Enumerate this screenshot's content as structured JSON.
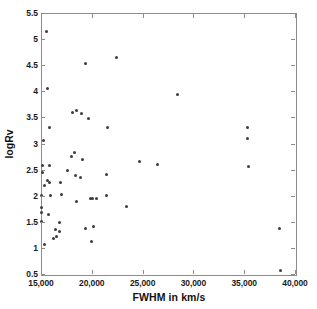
{
  "figure": {
    "top_clip_text": "· · · · · · · · · · · · · · · ·",
    "background_color": "#ffffff",
    "frame_color": "#8c8c8c",
    "marker_color": "#3b3b3b"
  },
  "chart_data": {
    "type": "scatter",
    "title": "",
    "xlabel": "FWHM in km/s",
    "ylabel": "logRv",
    "xlim": [
      15000,
      40000
    ],
    "ylim": [
      0.5,
      5.5
    ],
    "grid": false,
    "legend": null,
    "xticks": [
      15000,
      20000,
      25000,
      30000,
      35000,
      40000
    ],
    "xtick_labels": [
      "15,000",
      "20,000",
      "25,000",
      "30,000",
      "35,000",
      "40,000"
    ],
    "yticks": [
      0.5,
      1,
      1.5,
      2,
      2.5,
      3,
      3.5,
      4,
      4.5,
      5,
      5.5
    ],
    "ytick_labels": [
      "0.5",
      "1",
      "1.5",
      "2",
      "2.5",
      "3",
      "3.5",
      "4",
      "4.5",
      "5",
      "5.5"
    ],
    "marker": "dot",
    "points": [
      [
        15450,
        5.17
      ],
      [
        15520,
        4.08
      ],
      [
        19300,
        4.56
      ],
      [
        22300,
        4.67
      ],
      [
        28300,
        3.96
      ],
      [
        15750,
        3.33
      ],
      [
        18000,
        3.61
      ],
      [
        18400,
        3.66
      ],
      [
        18900,
        3.59
      ],
      [
        19600,
        3.5
      ],
      [
        21400,
        3.33
      ],
      [
        35200,
        3.33
      ],
      [
        35250,
        3.11
      ],
      [
        15100,
        3.07
      ],
      [
        18200,
        2.85
      ],
      [
        17950,
        2.77
      ],
      [
        18950,
        2.72
      ],
      [
        24550,
        2.68
      ],
      [
        26350,
        2.62
      ],
      [
        15050,
        2.6
      ],
      [
        15700,
        2.59
      ],
      [
        35300,
        2.57
      ],
      [
        15050,
        2.47
      ],
      [
        17550,
        2.51
      ],
      [
        21300,
        2.43
      ],
      [
        18300,
        2.41
      ],
      [
        18800,
        2.37
      ],
      [
        15550,
        2.31
      ],
      [
        15750,
        2.28
      ],
      [
        16800,
        2.28
      ],
      [
        15250,
        2.22
      ],
      [
        16900,
        2.04
      ],
      [
        15850,
        2.03
      ],
      [
        14980,
        2.02
      ],
      [
        19750,
        1.97
      ],
      [
        20000,
        1.96
      ],
      [
        20400,
        1.97
      ],
      [
        21350,
        2.02
      ],
      [
        18350,
        1.91
      ],
      [
        23350,
        1.81
      ],
      [
        14980,
        1.79
      ],
      [
        14980,
        1.7
      ],
      [
        15650,
        1.65
      ],
      [
        14980,
        1.52
      ],
      [
        16750,
        1.51
      ],
      [
        20050,
        1.43
      ],
      [
        19250,
        1.4
      ],
      [
        38400,
        1.4
      ],
      [
        16350,
        1.37
      ],
      [
        16700,
        1.33
      ],
      [
        16450,
        1.24
      ],
      [
        16150,
        1.19
      ],
      [
        15250,
        1.09
      ],
      [
        19900,
        1.15
      ],
      [
        38500,
        0.58
      ]
    ]
  }
}
